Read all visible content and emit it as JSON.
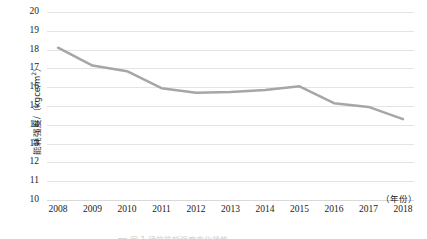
{
  "chart_data": {
    "type": "line",
    "title": "",
    "xlabel": "（年份）",
    "ylabel": "能耗强度/（kgce/m²）",
    "ylabel_main": "能耗强度/（kgce/m",
    "ylabel_sup": "2",
    "ylabel_tail": "）",
    "x_unit": "（年份）",
    "categories": [
      "2008",
      "2009",
      "2010",
      "2011",
      "2012",
      "2013",
      "2014",
      "2015",
      "2016",
      "2017",
      "2018"
    ],
    "values": [
      18.1,
      17.15,
      16.85,
      15.95,
      15.7,
      15.75,
      15.85,
      16.05,
      15.15,
      14.95,
      14.3
    ],
    "series": [
      {
        "name": "能耗强度",
        "color": "#a6a6a6",
        "values": [
          18.1,
          17.15,
          16.85,
          15.95,
          15.7,
          15.75,
          15.85,
          16.05,
          15.15,
          14.95,
          14.3
        ]
      }
    ],
    "ylim": [
      10,
      20
    ],
    "ytick_step": 1,
    "yticks": [
      "20",
      "19",
      "18",
      "17",
      "16",
      "15",
      "14",
      "13",
      "12",
      "11",
      "10"
    ],
    "grid": "horizontal",
    "legend": "none",
    "markers": "none",
    "line_width_px": 2.5
  },
  "colors": {
    "series_line": "#a6a6a6",
    "gridline": "#e4e4e4",
    "axis_base": "#d9d9d9",
    "text": "#1a1a1a",
    "background": "#ffffff"
  },
  "caption": {
    "fragment": "图 1  建筑能耗强度变化趋势"
  }
}
